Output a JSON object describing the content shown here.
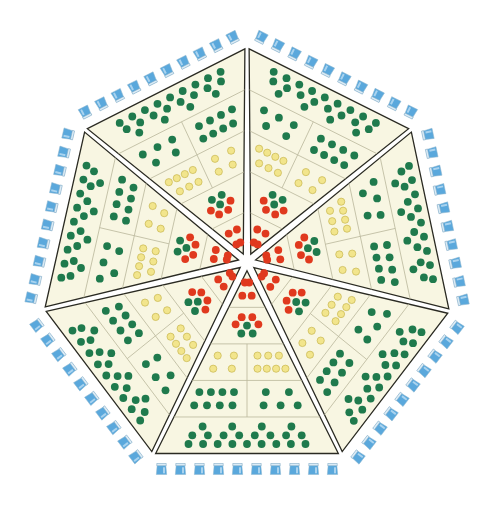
{
  "board": {
    "title": "Heptagonal Dot Board",
    "shape": "heptagon",
    "center": [
      247,
      262
    ],
    "vertices": [
      [
        247,
        45
      ],
      [
        413,
        128
      ],
      [
        452,
        312
      ],
      [
        342,
        456
      ],
      [
        152,
        456
      ],
      [
        42,
        310
      ],
      [
        83,
        128
      ]
    ],
    "wedge_gap": 4,
    "colors": {
      "background": "#ffffff",
      "cell": "#f8f6e2",
      "outline": "#2a2a22",
      "divider": "#b9b69a",
      "green": "#1f7a4d",
      "red": "#e0391e",
      "yellow": "#f2e58c",
      "cup": "#5aa8dc"
    },
    "wedge_count": 7,
    "row_boundaries": [
      0.0,
      0.2,
      0.4,
      0.6,
      0.8,
      1.0
    ],
    "rows": [
      {
        "name": "tip",
        "cells": [
          {
            "red": 4,
            "green": 0,
            "yellow": 0
          }
        ]
      },
      {
        "name": "inner",
        "cells": [
          {
            "red": 4,
            "green": 3,
            "yellow": 0
          }
        ]
      },
      {
        "name": "middle",
        "cells": [
          {
            "yellow": 7,
            "red": 0,
            "green": 0
          },
          {
            "yellow": 4,
            "red": 0,
            "green": 0
          }
        ]
      },
      {
        "name": "outer-inner",
        "cells": [
          {
            "green": 5,
            "red": 0,
            "yellow": 0
          },
          {
            "green": 8,
            "red": 0,
            "yellow": 0
          }
        ]
      },
      {
        "name": "outer",
        "cells": [
          {
            "green": 21,
            "red": 0,
            "yellow": 0
          }
        ]
      }
    ],
    "border": {
      "piece": "cup-icon",
      "cups_per_side": 10,
      "offset": 13
    }
  }
}
